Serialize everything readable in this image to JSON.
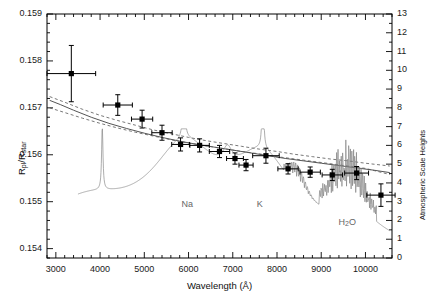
{
  "chart_data": {
    "type": "scatter",
    "title": "",
    "xlabel": "Wavelength (Å)",
    "ylabel": "R_pl/R_star",
    "ylabel_parts": {
      "num": "R",
      "num_sub": "pl",
      "den": "R",
      "den_sub": "star"
    },
    "y2label": "Atmospheric Scale Heights",
    "xlim": [
      2800,
      10600
    ],
    "ylim": [
      0.1538,
      0.159
    ],
    "y2lim": [
      0,
      13
    ],
    "grid": false,
    "legend": "none",
    "xticks": [
      3000,
      4000,
      5000,
      6000,
      7000,
      8000,
      9000,
      10000
    ],
    "xticklabels": [
      "3000",
      "4000",
      "5000",
      "6000",
      "7000",
      "8000",
      "9000",
      "10000"
    ],
    "yticks": [
      0.154,
      0.155,
      0.156,
      0.157,
      0.158,
      0.159
    ],
    "yticklabels": [
      "0.154",
      "0.155",
      "0.156",
      "0.157",
      "0.158",
      "0.159"
    ],
    "y2ticks": [
      0,
      1,
      2,
      3,
      4,
      5,
      6,
      7,
      8,
      9,
      10,
      11,
      12,
      13
    ],
    "y2ticklabels": [
      "0",
      "1",
      "2",
      "3",
      "4",
      "5",
      "6",
      "7",
      "8",
      "9",
      "10",
      "11",
      "12",
      "13"
    ],
    "x_minor_step": 200,
    "y_minor_step": 0.0002,
    "series": [
      {
        "name": "Measured transmission spectrum",
        "type": "scatter-errorbar",
        "marker": "filled-square",
        "color": "#000000",
        "points": [
          {
            "x": 3350,
            "y": 0.15773,
            "xerr": 550,
            "yerr": 0.0006
          },
          {
            "x": 4400,
            "y": 0.15706,
            "xerr": 330,
            "yerr": 0.00022
          },
          {
            "x": 4950,
            "y": 0.15676,
            "xerr": 240,
            "yerr": 0.00019
          },
          {
            "x": 5400,
            "y": 0.15647,
            "xerr": 230,
            "yerr": 0.00016
          },
          {
            "x": 5820,
            "y": 0.15622,
            "xerr": 200,
            "yerr": 0.00014
          },
          {
            "x": 6250,
            "y": 0.1562,
            "xerr": 220,
            "yerr": 0.00014
          },
          {
            "x": 6700,
            "y": 0.15607,
            "xerr": 230,
            "yerr": 0.00013
          },
          {
            "x": 7050,
            "y": 0.15592,
            "xerr": 190,
            "yerr": 0.00012
          },
          {
            "x": 7300,
            "y": 0.15578,
            "xerr": 160,
            "yerr": 0.00012
          },
          {
            "x": 7750,
            "y": 0.15598,
            "xerr": 300,
            "yerr": 0.00016
          },
          {
            "x": 8250,
            "y": 0.1557,
            "xerr": 230,
            "yerr": 0.00011
          },
          {
            "x": 8750,
            "y": 0.15563,
            "xerr": 230,
            "yerr": 0.00011
          },
          {
            "x": 9250,
            "y": 0.15557,
            "xerr": 230,
            "yerr": 0.00012
          },
          {
            "x": 9800,
            "y": 0.15561,
            "xerr": 270,
            "yerr": 0.00014
          },
          {
            "x": 10350,
            "y": 0.15514,
            "xerr": 320,
            "yerr": 0.00024
          }
        ]
      },
      {
        "name": "Best-fit model (solid)",
        "type": "line",
        "style": "solid",
        "color": "#555555",
        "points": [
          {
            "x": 2860,
            "y": 0.15716
          },
          {
            "x": 3100,
            "y": 0.15707
          },
          {
            "x": 3400,
            "y": 0.15695
          },
          {
            "x": 3800,
            "y": 0.1568
          },
          {
            "x": 4200,
            "y": 0.15667
          },
          {
            "x": 4600,
            "y": 0.15656
          },
          {
            "x": 5000,
            "y": 0.15646
          },
          {
            "x": 5400,
            "y": 0.15637
          },
          {
            "x": 5800,
            "y": 0.15629
          },
          {
            "x": 6200,
            "y": 0.15622
          },
          {
            "x": 6600,
            "y": 0.15616
          },
          {
            "x": 7000,
            "y": 0.1561
          },
          {
            "x": 7400,
            "y": 0.15604
          },
          {
            "x": 7800,
            "y": 0.15598
          },
          {
            "x": 8200,
            "y": 0.15592
          },
          {
            "x": 8600,
            "y": 0.15587
          },
          {
            "x": 9000,
            "y": 0.15582
          },
          {
            "x": 9400,
            "y": 0.15577
          },
          {
            "x": 9800,
            "y": 0.15572
          },
          {
            "x": 10200,
            "y": 0.15567
          },
          {
            "x": 10550,
            "y": 0.15562
          }
        ]
      },
      {
        "name": "Model upper 1-sigma (dashed)",
        "type": "line",
        "style": "dashed",
        "color": "#555555",
        "points": [
          {
            "x": 2860,
            "y": 0.15724
          },
          {
            "x": 3200,
            "y": 0.15712
          },
          {
            "x": 3600,
            "y": 0.15697
          },
          {
            "x": 4000,
            "y": 0.15684
          },
          {
            "x": 4400,
            "y": 0.15673
          },
          {
            "x": 4800,
            "y": 0.15663
          },
          {
            "x": 5200,
            "y": 0.15653
          },
          {
            "x": 5600,
            "y": 0.15645
          },
          {
            "x": 6000,
            "y": 0.15637
          },
          {
            "x": 6400,
            "y": 0.1563
          },
          {
            "x": 6800,
            "y": 0.15624
          },
          {
            "x": 7200,
            "y": 0.15618
          },
          {
            "x": 7600,
            "y": 0.15612
          },
          {
            "x": 8000,
            "y": 0.15607
          },
          {
            "x": 8400,
            "y": 0.15601
          },
          {
            "x": 8800,
            "y": 0.15596
          },
          {
            "x": 9200,
            "y": 0.15591
          },
          {
            "x": 9600,
            "y": 0.15587
          },
          {
            "x": 10000,
            "y": 0.15582
          },
          {
            "x": 10550,
            "y": 0.15576
          }
        ]
      },
      {
        "name": "Model lower 1-sigma (dashed)",
        "type": "line",
        "style": "dashed",
        "color": "#555555",
        "points": [
          {
            "x": 2860,
            "y": 0.157
          },
          {
            "x": 3200,
            "y": 0.1569
          },
          {
            "x": 3600,
            "y": 0.15678
          },
          {
            "x": 4000,
            "y": 0.15667
          },
          {
            "x": 4400,
            "y": 0.15657
          },
          {
            "x": 4800,
            "y": 0.15648
          },
          {
            "x": 5200,
            "y": 0.1564
          },
          {
            "x": 5600,
            "y": 0.15632
          },
          {
            "x": 6000,
            "y": 0.15625
          },
          {
            "x": 6400,
            "y": 0.15619
          },
          {
            "x": 6800,
            "y": 0.15613
          },
          {
            "x": 7200,
            "y": 0.15607
          },
          {
            "x": 7600,
            "y": 0.15602
          },
          {
            "x": 8000,
            "y": 0.15596
          },
          {
            "x": 8400,
            "y": 0.15591
          },
          {
            "x": 8800,
            "y": 0.15586
          },
          {
            "x": 9200,
            "y": 0.15581
          },
          {
            "x": 9600,
            "y": 0.15576
          },
          {
            "x": 10000,
            "y": 0.15571
          },
          {
            "x": 10550,
            "y": 0.15558
          }
        ]
      },
      {
        "name": "Model transmission spectrum (lower trace)",
        "type": "line",
        "style": "solid",
        "color": "#777777",
        "note": "High-resolution model showing Na, K and H2O absorption features, plotted near bottom of panel"
      }
    ],
    "annotations": [
      {
        "text": "Na",
        "x": 6000,
        "y": 0.15493,
        "name": "sodium-feature-label"
      },
      {
        "text": "K",
        "x": 7700,
        "y": 0.15493,
        "name": "potassium-feature-label"
      },
      {
        "text": "H2O",
        "html": "H<sub>2</sub>O",
        "x": 9550,
        "y": 0.15455,
        "name": "water-feature-label"
      }
    ]
  }
}
